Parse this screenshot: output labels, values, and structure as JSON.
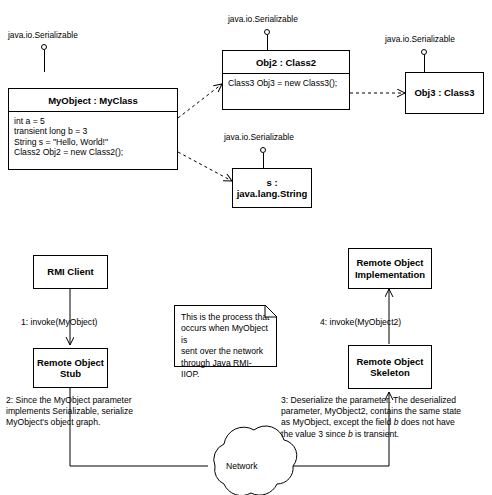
{
  "diagram": {
    "stroke_color": "#000000",
    "background_color": "#ffffff"
  },
  "object_diagram": {
    "interface_label": "java.io.Serializable",
    "classes": [
      {
        "id": "myobject",
        "title": "MyObject : MyClass",
        "attributes": "int a = 5\ntransient long b = 3\nString s = \"Hello, World!\"\nClass2 Obj2 = new Class2();",
        "interface_label": "java.io.Serializable"
      },
      {
        "id": "obj2",
        "title": "Obj2 : Class2",
        "attributes": "Class3 Obj3 = new Class3();",
        "interface_label": "java.io.Serializable"
      },
      {
        "id": "obj3",
        "title": "Obj3 : Class3",
        "attributes": "",
        "interface_label": "java.io.Serializable"
      },
      {
        "id": "string",
        "title": "s : java.lang.String",
        "attributes": "",
        "interface_label": "java.io.Serializable"
      }
    ]
  },
  "process_diagram": {
    "nodes": [
      {
        "id": "rmi-client",
        "label": "RMI Client"
      },
      {
        "id": "remote-object-stub",
        "label": "Remote Object\nStub"
      },
      {
        "id": "remote-object-implementation",
        "label": "Remote Object\nImplementation"
      },
      {
        "id": "remote-object-skeleton",
        "label": "Remote Object\nSkeleton"
      },
      {
        "id": "network-cloud",
        "label": "Network"
      }
    ],
    "note": "This is the process that\noccurs when MyObject is\nsent over the network\nthrough Java RMI-IIOP.",
    "steps": {
      "step1": "1: invoke(MyObject)",
      "step2": "2: Since the MyObject parameter\nimplements Serializable, serialize\nMyObject's object graph.",
      "step3_line1_a": "3: Deserialize the parameter.  The deserialized",
      "step3_line2_a": "parameter, MyObject2, contains the same state",
      "step3_line3_a": "as MyObject, except the field ",
      "step3_line3_i": "b",
      "step3_line3_b": " does not have",
      "step3_line4_a": "the value 3 since ",
      "step3_line4_i": "b",
      "step3_line4_b": " is transient.",
      "step4": "4: invoke(MyObject2)"
    }
  }
}
